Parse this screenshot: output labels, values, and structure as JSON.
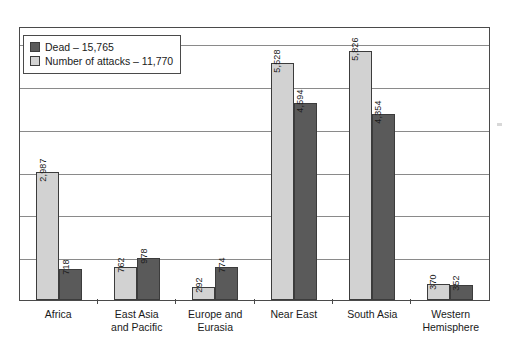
{
  "chart_data": {
    "type": "bar",
    "title": "",
    "xlabel": "",
    "ylabel": "",
    "ylim": [
      0,
      6400
    ],
    "grid": true,
    "gridline_interval": 1000,
    "legend_position": "top-left",
    "categories": [
      "Africa",
      "East Asia and Pacific",
      "Europe and Eurasia",
      "Near East",
      "South Asia",
      "Western Hemisphere"
    ],
    "series": [
      {
        "name": "Number of attacks – 11,770",
        "short_name": "Number of attacks",
        "total": 11770,
        "color": "#d2d2d2",
        "values": [
          2987,
          762,
          292,
          5528,
          5826,
          370
        ],
        "labels": [
          "2,987",
          "762",
          "292",
          "5,528",
          "5,826",
          "370"
        ]
      },
      {
        "name": "Dead – 15,765",
        "short_name": "Dead",
        "total": 15765,
        "color": "#5a5a5a",
        "values": [
          718,
          978,
          774,
          4594,
          4354,
          352
        ],
        "labels": [
          "718",
          "978",
          "774",
          "4,594",
          "4,354",
          "352"
        ]
      }
    ]
  },
  "legend": {
    "items": [
      {
        "label": "Dead – 15,765",
        "swatch": "dead"
      },
      {
        "label": "Number of attacks – 11,770",
        "swatch": "attacks"
      }
    ]
  },
  "categories_display": [
    {
      "lines": [
        "Africa"
      ]
    },
    {
      "lines": [
        "East Asia",
        "and Pacific"
      ]
    },
    {
      "lines": [
        "Europe and",
        "Eurasia"
      ]
    },
    {
      "lines": [
        "Near East"
      ]
    },
    {
      "lines": [
        "South Asia"
      ]
    },
    {
      "lines": [
        "Western",
        "Hemisphere"
      ]
    }
  ]
}
